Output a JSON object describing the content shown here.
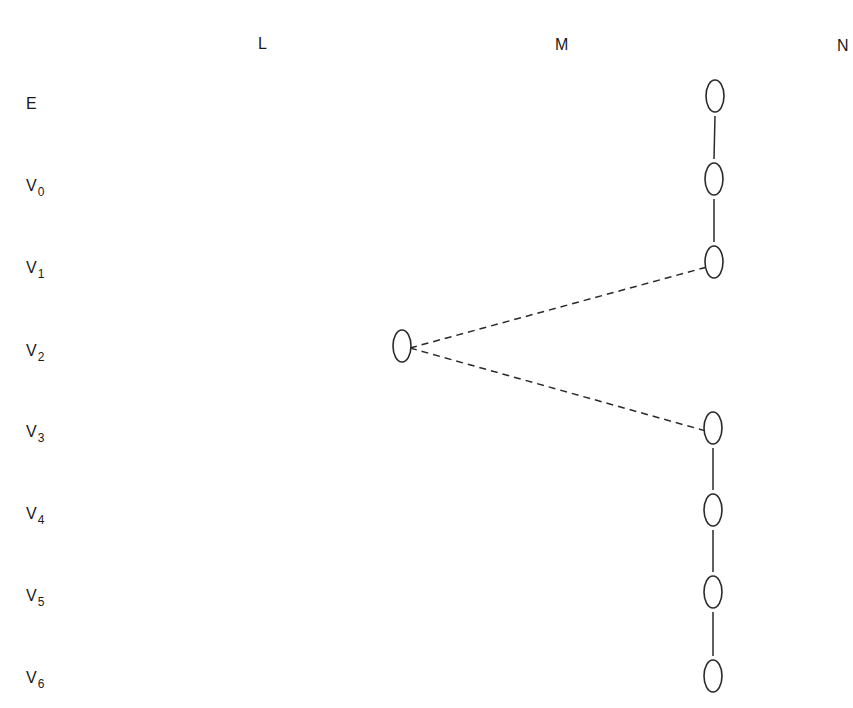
{
  "columns": [
    {
      "label": "L",
      "x": 258,
      "y": 36
    },
    {
      "label": "M",
      "x": 555,
      "y": 37
    },
    {
      "label": "N",
      "x": 837,
      "y": 38
    }
  ],
  "rows": [
    {
      "label": "E",
      "sub": "",
      "y": 96
    },
    {
      "label": "V",
      "sub": "0",
      "y": 178
    },
    {
      "label": "V",
      "sub": "1",
      "y": 260
    },
    {
      "label": "V",
      "sub": "2",
      "y": 343
    },
    {
      "label": "V",
      "sub": "3",
      "y": 424
    },
    {
      "label": "V",
      "sub": "4",
      "y": 506
    },
    {
      "label": "V",
      "sub": "5",
      "y": 588
    },
    {
      "label": "V",
      "sub": "6",
      "y": 670
    }
  ],
  "nodes": [
    {
      "id": "E-N",
      "cx": 715,
      "cy": 96
    },
    {
      "id": "V0-N",
      "cx": 714,
      "cy": 179
    },
    {
      "id": "V1-N",
      "cx": 714,
      "cy": 262
    },
    {
      "id": "V2-M",
      "cx": 402,
      "cy": 346
    },
    {
      "id": "V3-N",
      "cx": 713,
      "cy": 428
    },
    {
      "id": "V4-N",
      "cx": 713,
      "cy": 510
    },
    {
      "id": "V5-N",
      "cx": 713,
      "cy": 592
    },
    {
      "id": "V6-N",
      "cx": 713,
      "cy": 676
    }
  ],
  "edges": [
    {
      "from": "E-N",
      "to": "V0-N",
      "style": "solid"
    },
    {
      "from": "V0-N",
      "to": "V1-N",
      "style": "solid"
    },
    {
      "from": "V2-M",
      "to": "V1-N",
      "style": "dashed"
    },
    {
      "from": "V2-M",
      "to": "V3-N",
      "style": "dashed"
    },
    {
      "from": "V3-N",
      "to": "V4-N",
      "style": "solid"
    },
    {
      "from": "V4-N",
      "to": "V5-N",
      "style": "solid"
    },
    {
      "from": "V5-N",
      "to": "V6-N",
      "style": "solid"
    }
  ],
  "style": {
    "stroke": "#2a2a2a",
    "node_rx": 9,
    "node_ry": 16
  }
}
